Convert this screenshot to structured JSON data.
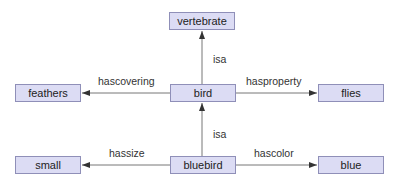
{
  "diagram": {
    "type": "semantic-network",
    "colors": {
      "node_fill": "#dcdcf4",
      "node_border": "#8f8fb8",
      "edge": "#666666",
      "text": "#222222"
    },
    "nodes": [
      {
        "id": "vertebrate",
        "label": "vertebrate"
      },
      {
        "id": "feathers",
        "label": "feathers"
      },
      {
        "id": "bird",
        "label": "bird"
      },
      {
        "id": "flies",
        "label": "flies"
      },
      {
        "id": "small",
        "label": "small"
      },
      {
        "id": "bluebird",
        "label": "bluebird"
      },
      {
        "id": "blue",
        "label": "blue"
      }
    ],
    "edges": [
      {
        "from": "bird",
        "to": "vertebrate",
        "label": "isa"
      },
      {
        "from": "bird",
        "to": "feathers",
        "label": "hascovering"
      },
      {
        "from": "bird",
        "to": "flies",
        "label": "hasproperty"
      },
      {
        "from": "bluebird",
        "to": "bird",
        "label": "isa"
      },
      {
        "from": "bluebird",
        "to": "small",
        "label": "hassize"
      },
      {
        "from": "bluebird",
        "to": "blue",
        "label": "hascolor"
      }
    ]
  }
}
